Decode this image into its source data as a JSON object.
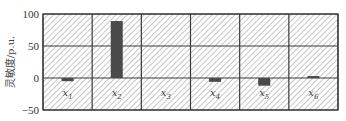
{
  "chart_data": {
    "type": "bar",
    "title": "",
    "xlabel": "",
    "ylabel": "灵敏度/p.u.",
    "categories": [
      "x1",
      "x2",
      "x3",
      "x4",
      "x5",
      "x6"
    ],
    "category_labels": [
      {
        "base": "x",
        "sub": "1"
      },
      {
        "base": "x",
        "sub": "2"
      },
      {
        "base": "x",
        "sub": "3"
      },
      {
        "base": "x",
        "sub": "4"
      },
      {
        "base": "x",
        "sub": "5"
      },
      {
        "base": "x",
        "sub": "6"
      }
    ],
    "values": [
      -5,
      89,
      0,
      -6,
      -12,
      3
    ],
    "ylim": [
      -50,
      100
    ],
    "yticks": [
      100,
      50,
      0,
      -50
    ],
    "grid": true,
    "legend": null,
    "background_pattern": "diagonal-hatch",
    "colors": {
      "bar": "#4a4a4a",
      "grid": "#3a3a3a",
      "hatch": "#b8b8b8",
      "background": "#ffffff"
    }
  }
}
